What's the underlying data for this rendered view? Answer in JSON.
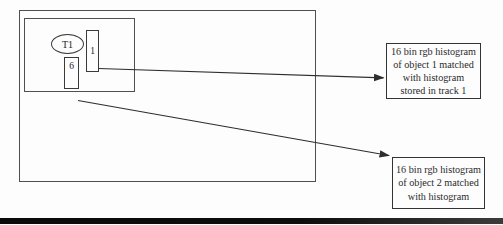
{
  "figure": {
    "track_ellipse_label": "T1",
    "object_rect_1_label": "1",
    "object_rect_6_label": "6",
    "histogram_box_1": {
      "lines": [
        "16 bin rgb histogram",
        "of object 1 matched",
        "with histogram",
        "stored in track 1"
      ]
    },
    "histogram_box_2": {
      "lines": [
        "16 bin rgb histogram",
        "of object 2 matched",
        "with histogram"
      ]
    }
  },
  "colors": {
    "background": "#fdfdfd",
    "frame_border": "#4f4f4f",
    "shape_border": "#3a3a3a",
    "arrow": "#2d2d2d",
    "text": "#2a2a2a",
    "bottom_rule_left": "#0a0a0a",
    "bottom_rule_right": "#3c3c3c"
  }
}
